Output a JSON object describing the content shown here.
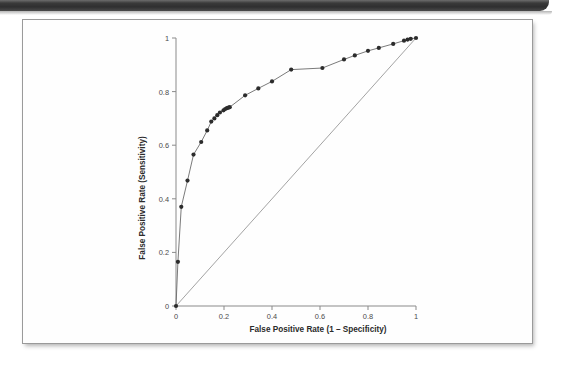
{
  "page": {
    "background_color": "#ffffff",
    "top_bar": {
      "name": "scan-header-bar",
      "color": "#2f2f30"
    },
    "figure_card": {
      "border_color": "#9a9a9a",
      "background": "#fefefe"
    }
  },
  "chart_data": {
    "type": "line",
    "title": "",
    "xlabel": "False Positive Rate (1 – Specificity)",
    "ylabel": "False Positive Rate (Sensitivity)",
    "xlim": [
      0,
      1
    ],
    "ylim": [
      0,
      1
    ],
    "grid": false,
    "legend": null,
    "xticks": [
      0,
      0.2,
      0.4,
      0.6,
      0.8,
      1
    ],
    "xticklabels": [
      "0",
      "0.2",
      "0.4",
      "0.6",
      "0.8",
      "1"
    ],
    "yticks": [
      0,
      0.2,
      0.4,
      0.6,
      0.8,
      1
    ],
    "yticklabels": [
      "0",
      "0.2",
      "0.4",
      "0.6",
      "0.8",
      "1"
    ],
    "marker": "filled-circle",
    "marker_color": "#2c2c2c",
    "line_color": "#6b6b6b",
    "reference_line": {
      "name": "chance-diagonal",
      "x": [
        0,
        1
      ],
      "y": [
        0,
        1
      ],
      "color": "#8c8c8c"
    },
    "series": [
      {
        "name": "ROC curve",
        "x": [
          0.0,
          0.008,
          0.022,
          0.048,
          0.073,
          0.105,
          0.13,
          0.147,
          0.16,
          0.172,
          0.183,
          0.198,
          0.205,
          0.212,
          0.218,
          0.224,
          0.288,
          0.343,
          0.4,
          0.48,
          0.61,
          0.7,
          0.745,
          0.8,
          0.845,
          0.905,
          0.95,
          0.965,
          0.978,
          1.0
        ],
        "y": [
          0.0,
          0.165,
          0.37,
          0.468,
          0.565,
          0.612,
          0.655,
          0.688,
          0.7,
          0.712,
          0.722,
          0.73,
          0.735,
          0.738,
          0.74,
          0.742,
          0.786,
          0.812,
          0.838,
          0.882,
          0.888,
          0.92,
          0.935,
          0.952,
          0.963,
          0.978,
          0.99,
          0.994,
          0.997,
          1.0
        ]
      }
    ]
  }
}
